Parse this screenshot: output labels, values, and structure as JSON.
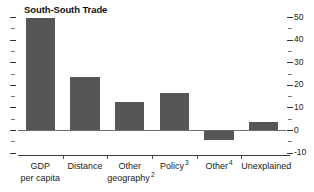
{
  "chart_data": {
    "type": "bar",
    "title": "South-South Trade",
    "xlabel": "",
    "ylabel": "",
    "categories": [
      "GDP per capita",
      "Distance",
      "Other geography",
      "Policy",
      "Other",
      "Unexplained"
    ],
    "category_labels": [
      {
        "line1": "GDP",
        "line2": "per capita",
        "footnote": ""
      },
      {
        "line1": "Distance",
        "line2": "",
        "footnote": ""
      },
      {
        "line1": "Other",
        "line2": "geography",
        "footnote": "2"
      },
      {
        "line1": "Policy",
        "line2": "",
        "footnote": "3"
      },
      {
        "line1": "Other",
        "line2": "",
        "footnote": "4"
      },
      {
        "line1": "Unexplained",
        "line2": "",
        "footnote": ""
      }
    ],
    "values": [
      49.5,
      23.5,
      12.5,
      16.5,
      -4.5,
      3.5
    ],
    "ylim": [
      -10,
      50
    ],
    "yticks": [
      50,
      40,
      30,
      20,
      10,
      0,
      -10
    ],
    "ytick_labels": [
      "50",
      "40",
      "30",
      "20",
      "10",
      "0",
      "-10"
    ],
    "yminor_ticks": [
      45,
      35,
      25,
      15,
      5,
      -5
    ],
    "grid": false,
    "legend": "none",
    "axis_position": "right",
    "bar_color": "#565656",
    "axis_color": "#4a4a4a",
    "zero_line_color": "#6d6d6d"
  }
}
